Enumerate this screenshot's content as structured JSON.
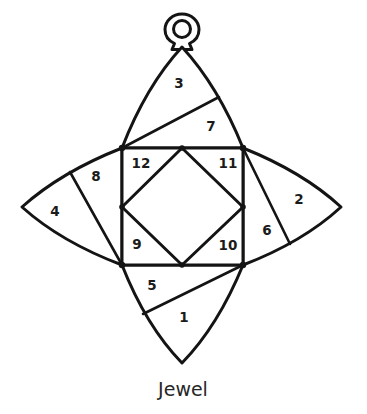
{
  "figure": {
    "caption": "Jewel",
    "title": "Jewel",
    "kind": "pieced-block-diagram",
    "background_color": "#ffffff",
    "line_color": "#141414",
    "text_color": "#1b1b1b",
    "caption_color": "#262626"
  },
  "ornament": {
    "hanger_icon": "ring-loop-icon",
    "hanger_center": {
      "x": 182,
      "y": 31
    },
    "hanger_radius": 9
  },
  "pieces": [
    {
      "id": "1",
      "label": "1",
      "x": 184,
      "y": 318,
      "region": "bottom-petal-lower"
    },
    {
      "id": "2",
      "label": "2",
      "x": 299,
      "y": 200,
      "region": "right-petal-outer"
    },
    {
      "id": "3",
      "label": "3",
      "x": 179,
      "y": 84,
      "region": "top-petal-upper"
    },
    {
      "id": "4",
      "label": "4",
      "x": 55,
      "y": 212,
      "region": "left-petal-outer"
    },
    {
      "id": "5",
      "label": "5",
      "x": 152,
      "y": 286,
      "region": "bottom-petal-upper"
    },
    {
      "id": "6",
      "label": "6",
      "x": 267,
      "y": 231,
      "region": "right-petal-inner"
    },
    {
      "id": "7",
      "label": "7",
      "x": 211,
      "y": 127,
      "region": "top-petal-lower"
    },
    {
      "id": "8",
      "label": "8",
      "x": 96,
      "y": 177,
      "region": "left-petal-inner"
    },
    {
      "id": "9",
      "label": "9",
      "x": 137,
      "y": 245,
      "region": "square-corner-bottom-left"
    },
    {
      "id": "10",
      "label": "10",
      "x": 228,
      "y": 246,
      "region": "square-corner-bottom-right"
    },
    {
      "id": "11",
      "label": "11",
      "x": 228,
      "y": 164,
      "region": "square-corner-top-right"
    },
    {
      "id": "12",
      "label": "12",
      "x": 141,
      "y": 164,
      "region": "square-corner-top-left"
    }
  ],
  "geometry": {
    "inner_square": {
      "top_left": {
        "x": 122,
        "y": 148
      },
      "top_right": {
        "x": 243,
        "y": 148
      },
      "bottom_right": {
        "x": 243,
        "y": 265
      },
      "bottom_left": {
        "x": 122,
        "y": 265
      }
    },
    "inner_diamond": {
      "top": {
        "x": 182,
        "y": 148
      },
      "right": {
        "x": 243,
        "y": 207
      },
      "bottom": {
        "x": 182,
        "y": 265
      },
      "left": {
        "x": 122,
        "y": 207
      }
    },
    "star_tips": {
      "top": {
        "x": 182,
        "y": 47
      },
      "right": {
        "x": 341,
        "y": 207
      },
      "bottom": {
        "x": 182,
        "y": 363
      },
      "left": {
        "x": 22,
        "y": 207
      }
    },
    "petal_splits": {
      "top_petal_split_point": {
        "x": 219,
        "y": 97
      },
      "right_petal_split_point": {
        "x": 290,
        "y": 244
      },
      "bottom_petal_split_point": {
        "x": 143,
        "y": 314
      },
      "left_petal_split_point": {
        "x": 70,
        "y": 172
      }
    }
  }
}
